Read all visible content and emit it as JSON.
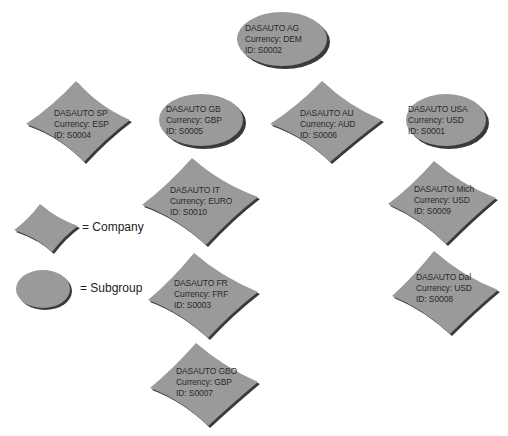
{
  "diagram": {
    "colors": {
      "fill": "#9a9a9a",
      "shadow": "#3a3a3a",
      "text": "#2a2a2a",
      "background": "#ffffff"
    },
    "nodes": [
      {
        "id": "ag",
        "shape": "subgroup",
        "name": "DASAUTO AG",
        "currency": "Currency: DEM",
        "code": "ID: S0002"
      },
      {
        "id": "sp",
        "shape": "company",
        "name": "DASAUTO SP",
        "currency": "Currency: ESP",
        "code": "ID: S0004"
      },
      {
        "id": "gb",
        "shape": "subgroup",
        "name": "DASAUTO GB",
        "currency": "Currency: GBP",
        "code": "ID: S0005"
      },
      {
        "id": "au",
        "shape": "company",
        "name": "DASAUTO AU",
        "currency": "Currency: AUD",
        "code": "ID: S0006"
      },
      {
        "id": "usa",
        "shape": "subgroup",
        "name": "DASAUTO USA",
        "currency": "Currency: USD",
        "code": "ID: S0001"
      },
      {
        "id": "it",
        "shape": "company",
        "name": "DASAUTO IT",
        "currency": "Currency: EURO",
        "code": "ID: S0010"
      },
      {
        "id": "mich",
        "shape": "company",
        "name": "DASAUTO Mich",
        "currency": "Currency: USD",
        "code": "ID: S0009"
      },
      {
        "id": "fr",
        "shape": "company",
        "name": "DASAUTO FR",
        "currency": "Currency: FRF",
        "code": "ID: S0003"
      },
      {
        "id": "dal",
        "shape": "company",
        "name": "DASAUTO Dal",
        "currency": "Currency: USD",
        "code": "ID: S0008"
      },
      {
        "id": "gbo",
        "shape": "company",
        "name": "DASAUTO GBO",
        "currency": "Currency: GBP",
        "code": "ID: S0007"
      }
    ],
    "legend": {
      "company": "= Company",
      "subgroup": "= Subgroup"
    }
  }
}
